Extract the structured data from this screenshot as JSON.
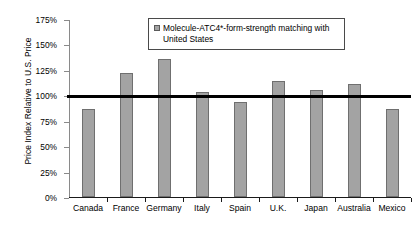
{
  "chart_data": {
    "type": "bar",
    "title": "",
    "xlabel": "",
    "ylabel": "Price Index Relative to U.S. Price",
    "categories": [
      "Canada",
      "France",
      "Germany",
      "Italy",
      "Spain",
      "U.K.",
      "Japan",
      "Australia",
      "Mexico"
    ],
    "values": [
      87,
      122,
      136,
      103,
      93,
      114,
      105,
      111,
      87
    ],
    "series": [
      {
        "name": "Molecule-ATC4*-form-strength matching with United States",
        "values": [
          87,
          122,
          136,
          103,
          93,
          114,
          105,
          111,
          87
        ]
      }
    ],
    "ylim": [
      0,
      175
    ],
    "ytick_values": [
      0,
      25,
      50,
      75,
      100,
      125,
      150,
      175
    ],
    "ytick_labels": [
      "0%",
      "25%",
      "50%",
      "75%",
      "100%",
      "125%",
      "150%",
      "175%"
    ],
    "grid": false,
    "legend_position": "top-center",
    "annotations": [
      {
        "type": "reference-line",
        "orientation": "horizontal",
        "value": 100,
        "label": "",
        "color": "#000000"
      }
    ],
    "bar_color": "#a3a3a3",
    "bar_border_color": "#6f6f6f"
  },
  "legend": {
    "marker_name": "series-swatch",
    "text": "Molecule-ATC4*-form-strength matching with United States"
  },
  "axes": {
    "y_title": "Price Index Relative to U.S. Price"
  }
}
